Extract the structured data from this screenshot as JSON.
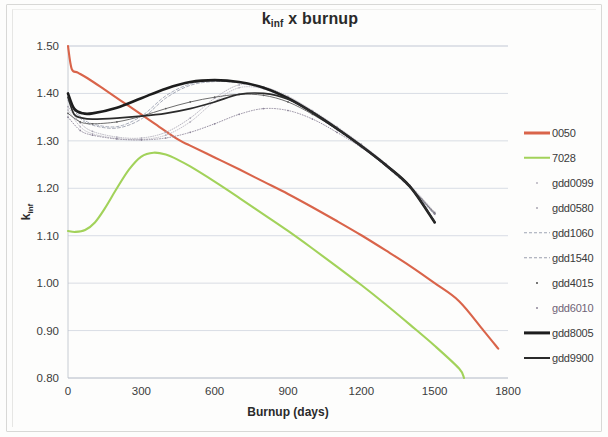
{
  "chart_data": {
    "type": "line",
    "title_main": "k",
    "title_sub": "inf",
    "title_rest": " x burnup",
    "xlabel": "Burnup (days)",
    "ylabel": "k_inf",
    "ylabel_main": "k",
    "ylabel_sub": "inf",
    "xlim": [
      0,
      1800
    ],
    "ylim": [
      0.8,
      1.5
    ],
    "xticks": [
      0,
      300,
      600,
      900,
      1200,
      1500,
      1800
    ],
    "yticks": [
      "0.80",
      "0.90",
      "1.00",
      "1.10",
      "1.20",
      "1.30",
      "1.40",
      "1.50"
    ],
    "ytick_values": [
      0.8,
      0.9,
      1.0,
      1.1,
      1.2,
      1.3,
      1.4,
      1.5
    ],
    "grid": "horizontal",
    "legend_position": "right",
    "series": [
      {
        "name": "0050",
        "color": "#d9644a",
        "width": 2.1,
        "style": "solid",
        "marker": "none",
        "x": [
          0,
          15,
          40,
          80,
          150,
          250,
          350,
          450,
          500,
          600,
          700,
          800,
          900,
          1000,
          1100,
          1200,
          1300,
          1400,
          1500,
          1600,
          1700,
          1760
        ],
        "y": [
          1.5,
          1.452,
          1.444,
          1.432,
          1.408,
          1.373,
          1.338,
          1.303,
          1.29,
          1.265,
          1.24,
          1.214,
          1.188,
          1.16,
          1.131,
          1.101,
          1.069,
          1.036,
          1.0,
          0.962,
          0.9,
          0.862
        ]
      },
      {
        "name": "7028",
        "color": "#a2d25a",
        "width": 2.1,
        "style": "solid",
        "marker": "none",
        "x": [
          0,
          30,
          70,
          110,
          150,
          200,
          250,
          300,
          350,
          400,
          450,
          500,
          600,
          700,
          800,
          900,
          1000,
          1100,
          1200,
          1300,
          1400,
          1500,
          1600,
          1620
        ],
        "y": [
          1.11,
          1.108,
          1.112,
          1.128,
          1.157,
          1.2,
          1.24,
          1.267,
          1.275,
          1.271,
          1.26,
          1.246,
          1.214,
          1.18,
          1.145,
          1.11,
          1.073,
          1.035,
          0.996,
          0.955,
          0.912,
          0.868,
          0.82,
          0.8
        ]
      },
      {
        "name": "gdd0099",
        "color": "#b6b2be",
        "width": 0.8,
        "style": "dotted",
        "marker": "dot",
        "x": [
          0,
          50,
          100,
          200,
          300,
          400,
          500,
          600,
          700,
          800,
          900,
          1000,
          1100,
          1200,
          1300,
          1400,
          1500
        ],
        "y": [
          1.365,
          1.33,
          1.315,
          1.305,
          1.303,
          1.312,
          1.34,
          1.383,
          1.412,
          1.41,
          1.392,
          1.362,
          1.328,
          1.292,
          1.252,
          1.206,
          1.15
        ]
      },
      {
        "name": "gdd0580",
        "color": "#a8a4b2",
        "width": 0.8,
        "style": "dotted",
        "marker": "dot",
        "x": [
          0,
          50,
          100,
          200,
          300,
          400,
          500,
          600,
          700,
          800,
          900,
          1000,
          1100,
          1200,
          1300,
          1400,
          1500
        ],
        "y": [
          1.372,
          1.338,
          1.32,
          1.308,
          1.306,
          1.318,
          1.348,
          1.39,
          1.418,
          1.414,
          1.394,
          1.364,
          1.33,
          1.293,
          1.252,
          1.205,
          1.148
        ]
      },
      {
        "name": "gdd1060",
        "color": "#9fa5b4",
        "width": 0.9,
        "style": "dashed",
        "marker": "none",
        "x": [
          0,
          50,
          100,
          200,
          300,
          400,
          500,
          600,
          700,
          800,
          900,
          1000,
          1100,
          1200,
          1300,
          1400,
          1500
        ],
        "y": [
          1.392,
          1.352,
          1.336,
          1.33,
          1.352,
          1.395,
          1.42,
          1.427,
          1.424,
          1.412,
          1.39,
          1.36,
          1.325,
          1.288,
          1.248,
          1.202,
          1.145
        ]
      },
      {
        "name": "gdd1540",
        "color": "#9b9fae",
        "width": 0.9,
        "style": "dashed",
        "marker": "none",
        "x": [
          0,
          50,
          100,
          200,
          300,
          400,
          500,
          600,
          700,
          800,
          900,
          1000,
          1100,
          1200,
          1300,
          1400,
          1500
        ],
        "y": [
          1.385,
          1.348,
          1.333,
          1.327,
          1.346,
          1.39,
          1.417,
          1.425,
          1.422,
          1.41,
          1.388,
          1.358,
          1.323,
          1.287,
          1.246,
          1.2,
          1.144
        ]
      },
      {
        "name": "gdd4015",
        "color": "#5c5c5c",
        "width": 0.9,
        "style": "solid",
        "marker": "dot",
        "x": [
          0,
          50,
          100,
          200,
          300,
          400,
          500,
          600,
          700,
          800,
          900,
          1000,
          1100,
          1200,
          1300,
          1400,
          1500
        ],
        "y": [
          1.358,
          1.34,
          1.336,
          1.34,
          1.352,
          1.368,
          1.382,
          1.392,
          1.398,
          1.396,
          1.382,
          1.356,
          1.324,
          1.289,
          1.249,
          1.203,
          1.147
        ]
      },
      {
        "name": "gdd6010",
        "color": "#8c8598",
        "width": 0.9,
        "style": "dotted",
        "marker": "dot",
        "x": [
          0,
          50,
          100,
          200,
          300,
          400,
          500,
          600,
          700,
          800,
          900,
          1000,
          1100,
          1200,
          1300,
          1400,
          1500
        ],
        "y": [
          1.35,
          1.322,
          1.312,
          1.304,
          1.302,
          1.306,
          1.318,
          1.336,
          1.356,
          1.368,
          1.364,
          1.346,
          1.318,
          1.286,
          1.247,
          1.202,
          1.146
        ]
      },
      {
        "name": "gdd8005",
        "color": "#1d1d1d",
        "width": 2.6,
        "style": "solid",
        "marker": "none",
        "x": [
          0,
          25,
          60,
          100,
          200,
          300,
          400,
          500,
          600,
          700,
          800,
          900,
          1000,
          1100,
          1200,
          1300,
          1400,
          1500
        ],
        "y": [
          1.4,
          1.368,
          1.358,
          1.358,
          1.37,
          1.39,
          1.41,
          1.424,
          1.428,
          1.424,
          1.412,
          1.39,
          1.36,
          1.326,
          1.289,
          1.249,
          1.203,
          1.128
        ]
      },
      {
        "name": "gdd9900",
        "color": "#2b2b2b",
        "width": 1.7,
        "style": "solid",
        "marker": "none",
        "x": [
          0,
          25,
          60,
          100,
          200,
          300,
          400,
          500,
          600,
          700,
          800,
          900,
          1000,
          1100,
          1200,
          1300,
          1400,
          1500
        ],
        "y": [
          1.392,
          1.356,
          1.348,
          1.346,
          1.348,
          1.352,
          1.358,
          1.368,
          1.382,
          1.398,
          1.4,
          1.388,
          1.36,
          1.326,
          1.289,
          1.249,
          1.203,
          1.13
        ]
      }
    ]
  },
  "legend": {
    "items": [
      {
        "label": "0050",
        "color": "#d9644a",
        "style": "solid",
        "width": 3,
        "tint": false
      },
      {
        "label": "7028",
        "color": "#a2d25a",
        "style": "solid",
        "width": 2.5,
        "tint": false
      },
      {
        "label": "gdd0099",
        "color": "#b6b2be",
        "style": "dot",
        "width": 1,
        "tint": false
      },
      {
        "label": "gdd0580",
        "color": "#a8a4b2",
        "style": "dot",
        "width": 1,
        "tint": false
      },
      {
        "label": "gdd1060",
        "color": "#9fa5b4",
        "style": "dashed",
        "width": 1.5,
        "tint": false
      },
      {
        "label": "gdd1540",
        "color": "#9b9fae",
        "style": "dashed",
        "width": 1.5,
        "tint": false
      },
      {
        "label": "gdd4015",
        "color": "#4a4a4a",
        "style": "dot",
        "width": 1,
        "tint": false
      },
      {
        "label": "gdd6010",
        "color": "#8c8598",
        "style": "dot",
        "width": 1,
        "tint": true
      },
      {
        "label": "gdd8005",
        "color": "#1d1d1d",
        "style": "solid",
        "width": 3.2,
        "tint": false
      },
      {
        "label": "gdd9900",
        "color": "#2b2b2b",
        "style": "solid",
        "width": 2,
        "tint": false
      }
    ]
  }
}
